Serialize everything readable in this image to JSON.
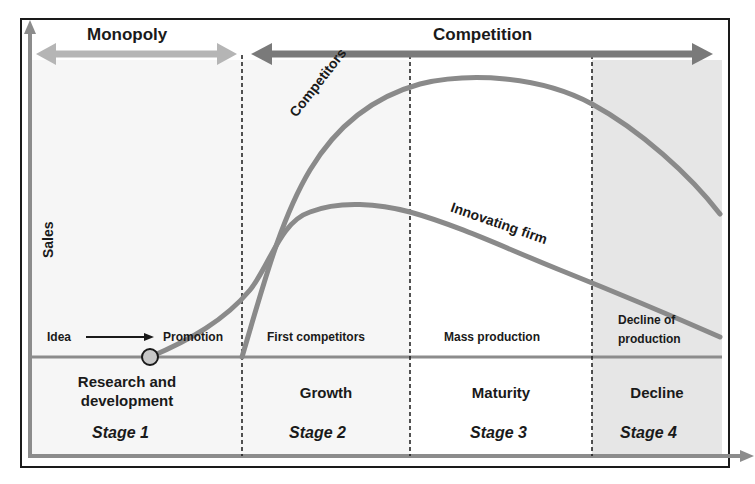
{
  "diagram": {
    "type": "product-life-cycle",
    "y_axis_label": "Sales",
    "phases": [
      {
        "label": "Monopoly",
        "spans_stages": [
          1
        ]
      },
      {
        "label": "Competition",
        "spans_stages": [
          2,
          3,
          4
        ]
      }
    ],
    "curves": [
      {
        "label": "Competitors",
        "color": "#8a8a8a"
      },
      {
        "label": "Innovating firm",
        "color": "#8a8a8a"
      }
    ],
    "milestones": {
      "idea": "Idea",
      "promotion": "Promotion"
    },
    "stages": [
      {
        "number": "Stage 1",
        "name_line1": "Research and",
        "name_line2": "development",
        "descriptor": ""
      },
      {
        "number": "Stage 2",
        "name_line1": "Growth",
        "name_line2": "",
        "descriptor": "First competitors"
      },
      {
        "number": "Stage 3",
        "name_line1": "Maturity",
        "name_line2": "",
        "descriptor": "Mass production"
      },
      {
        "number": "Stage 4",
        "name_line1": "Decline",
        "name_line2": "",
        "descriptor_line1": "Decline of",
        "descriptor_line2": "production"
      }
    ],
    "colors": {
      "arrow_monopoly": "#b5b5b5",
      "arrow_competition": "#7a7a7a",
      "axis": "#8c8c8c",
      "stage4_bg": "#e6e6e6",
      "early_bg": "#f6f6f6",
      "text": "#1a1a1a"
    }
  }
}
